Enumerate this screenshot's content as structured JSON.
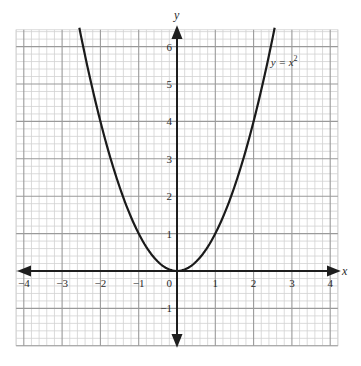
{
  "chart_data": {
    "type": "line",
    "title": "",
    "xlabel": "x",
    "ylabel": "y",
    "xlim": [
      -4.2,
      4.2
    ],
    "ylim": [
      -2,
      6.45
    ],
    "grid": true,
    "grid_minor_divisions": 5,
    "x_ticks": [
      -4,
      -3,
      -2,
      -1,
      0,
      1,
      2,
      3,
      4
    ],
    "x_tick_labels": [
      "−4",
      "−3",
      "−2",
      "−1",
      "0",
      "1",
      "2",
      "3",
      "4"
    ],
    "y_ticks": [
      -1,
      1,
      2,
      3,
      4,
      5,
      6
    ],
    "y_tick_labels": [
      "−1",
      "1",
      "2",
      "3",
      "4",
      "5",
      "6"
    ],
    "origin_label": "0",
    "series": [
      {
        "name": "y = x²",
        "function": "x^2",
        "x_range": [
          -2.55,
          2.55
        ],
        "x": [
          -2.5,
          -2,
          -1.5,
          -1,
          -0.5,
          0,
          0.5,
          1,
          1.5,
          2,
          2.5
        ],
        "y": [
          6.25,
          4,
          2.25,
          1,
          0.25,
          0,
          0.25,
          1,
          2.25,
          4,
          6.25
        ]
      }
    ],
    "annotations": [
      {
        "text_prefix": "y = x",
        "superscript": "2",
        "x": 2.45,
        "y": 5.6
      }
    ],
    "colors": {
      "major_grid": "#9a9a9a",
      "minor_grid": "#d2d2d2",
      "axis": "#1e1e1e",
      "curve": "#1a1a1a"
    }
  },
  "layout": {
    "origin_px": [
      177,
      271
    ],
    "unit_x_px": 38.3,
    "unit_y_px": 37.4
  }
}
